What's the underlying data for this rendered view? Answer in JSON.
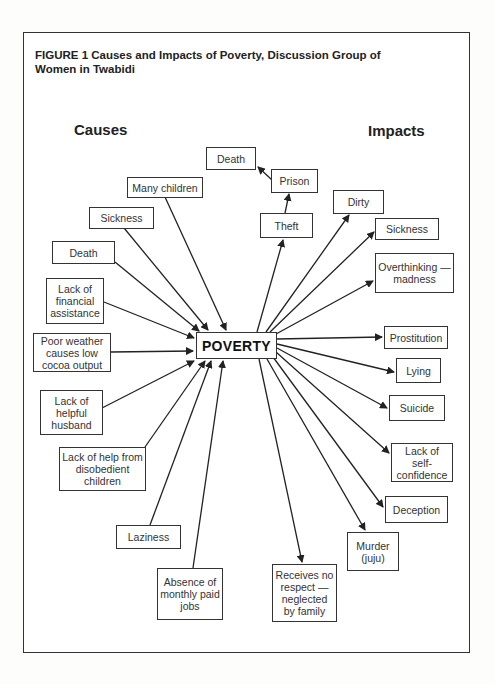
{
  "figure": {
    "title": "FIGURE 1  Causes and Impacts of Poverty, Discussion Group of Women in Twabidi",
    "causes_label": "Causes",
    "impacts_label": "Impacts",
    "center": "POVERTY"
  },
  "causes": [
    {
      "id": "many-children",
      "label": "Many children"
    },
    {
      "id": "sickness",
      "label": "Sickness"
    },
    {
      "id": "death",
      "label": "Death"
    },
    {
      "id": "lack-financial-assistance",
      "label": "Lack of financial assistance"
    },
    {
      "id": "poor-weather",
      "label": "Poor weather causes low cocoa output"
    },
    {
      "id": "lack-helpful-husband",
      "label": "Lack of helpful husband"
    },
    {
      "id": "lack-help-children",
      "label": "Lack of help from disobedient children"
    },
    {
      "id": "laziness",
      "label": "Laziness"
    },
    {
      "id": "absence-jobs",
      "label": "Absence of monthly paid jobs"
    }
  ],
  "impacts": [
    {
      "id": "theft",
      "label": "Theft"
    },
    {
      "id": "prison",
      "label": "Prison"
    },
    {
      "id": "death-impact",
      "label": "Death"
    },
    {
      "id": "dirty",
      "label": "Dirty"
    },
    {
      "id": "sickness-impact",
      "label": "Sickness"
    },
    {
      "id": "overthinking",
      "label": "Overthinking — madness"
    },
    {
      "id": "prostitution",
      "label": "Prostitution"
    },
    {
      "id": "lying",
      "label": "Lying"
    },
    {
      "id": "suicide",
      "label": "Suicide"
    },
    {
      "id": "lack-self-confidence",
      "label": "Lack of self-confidence"
    },
    {
      "id": "deception",
      "label": "Deception"
    },
    {
      "id": "murder",
      "label": "Murder (juju)"
    },
    {
      "id": "no-respect",
      "label": "Receives no respect — neglected by family"
    }
  ],
  "chains": [
    {
      "from": "POVERTY",
      "to": "Theft"
    },
    {
      "from": "Theft",
      "to": "Prison"
    },
    {
      "from": "Prison",
      "to": "Death"
    }
  ]
}
